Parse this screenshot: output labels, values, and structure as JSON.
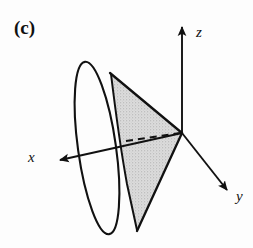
{
  "figure": {
    "panel_label": "(c)",
    "background_color": "#fdfdfd",
    "stroke_color": "#111111",
    "shade_fill_color": "#d6d6d6",
    "shade_stipple_color": "#9a9a9a",
    "axes": [
      {
        "id": "z",
        "label": "z",
        "direction": "up",
        "tip": [
          182,
          22
        ],
        "origin": [
          182,
          133
        ]
      },
      {
        "id": "y",
        "label": "y",
        "direction": "down-right",
        "tip": [
          231,
          193
        ],
        "origin": [
          182,
          133
        ]
      },
      {
        "id": "x",
        "label": "x",
        "direction": "down-left",
        "tip": [
          56,
          161
        ],
        "origin": [
          182,
          133
        ]
      }
    ],
    "cone": {
      "apex": [
        182,
        133
      ],
      "rim_center": [
        97,
        148
      ],
      "rim_rx": 19,
      "rim_ry": 87,
      "rim_rotation_deg": -8
    },
    "dashed_line": {
      "from": [
        126,
        141
      ],
      "to": [
        181,
        133
      ],
      "dash": "7 5"
    },
    "shaded_region": "triangular axial cross-section from apex to upper rim point and lower rim point"
  }
}
